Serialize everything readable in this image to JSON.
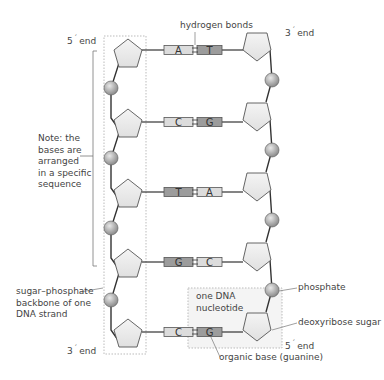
{
  "labels": {
    "top_left_end": {
      "num": "5",
      "prime": "´",
      "text": "end"
    },
    "top_right_end": {
      "num": "3",
      "prime": "´",
      "text": "end"
    },
    "bottom_left_end": {
      "num": "3",
      "prime": "´",
      "text": "end"
    },
    "bottom_right_end": {
      "num": "5",
      "prime": "´",
      "text": "end"
    },
    "hydrogen_bonds": "hydrogen bonds",
    "note": "Note: the\nbases are\narranged\nin a specific\nsequence",
    "backbone": "sugar–phosphate\nbackbone of one\nDNA strand",
    "nucleotide": "one DNA\nnucleotide",
    "phosphate": "phosphate",
    "sugar": "deoxyribose sugar",
    "organic_base": "organic base (guanine)"
  },
  "base_pairs": [
    {
      "left": "A",
      "right": "T"
    },
    {
      "left": "C",
      "right": "G"
    },
    {
      "left": "T",
      "right": "A"
    },
    {
      "left": "G",
      "right": "C"
    },
    {
      "left": "C",
      "right": "G"
    }
  ],
  "colors": {
    "pentagon_fill": "#eeeeee",
    "stroke": "#333333",
    "phosphate_fill": "#a8a8a8",
    "base_light": "#dcdcdc",
    "base_dark": "#9c9c9c",
    "text": "#444444"
  }
}
